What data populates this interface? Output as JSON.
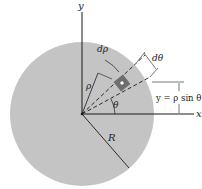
{
  "figure": {
    "type": "polar-coordinates-disk-diagram",
    "colors": {
      "disk_fill": "#c4c4c4",
      "element_fill": "#6e6e6e",
      "line": "#1a1a1a",
      "background": "#ffffff"
    },
    "labels": {
      "y_axis": "y",
      "x_axis": "x",
      "d_rho": "dρ",
      "d_theta": "dθ",
      "rho": "ρ",
      "theta": "θ",
      "radius": "R",
      "y_relation": "y = ρ sin θ"
    }
  }
}
